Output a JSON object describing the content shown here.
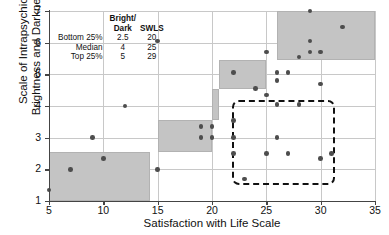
{
  "chart_data": {
    "type": "scatter",
    "title": "",
    "xlabel": "Satisfaction with Life Scale",
    "ylabel": "Scale of Intrapsychic Brightness and Darkness",
    "ylabel_line1": "Scale of Intrapsychic",
    "ylabel_line2": "Brightness and Darkness",
    "xlim": [
      5,
      35
    ],
    "ylim": [
      1,
      7
    ],
    "xticks": [
      5,
      10,
      15,
      20,
      25,
      30,
      35
    ],
    "yticks": [
      1,
      2,
      3,
      4,
      5,
      6,
      7
    ],
    "grid": true,
    "legend": "none",
    "marker_color": "#4d4d4d",
    "shade_color": "#c4c4c4",
    "dash_color": "#111111",
    "points": [
      {
        "x": 5,
        "y": 1.35
      },
      {
        "x": 7,
        "y": 2.0
      },
      {
        "x": 9,
        "y": 3.0
      },
      {
        "x": 10,
        "y": 2.35
      },
      {
        "x": 12,
        "y": 4.0
      },
      {
        "x": 15,
        "y": 6.05
      },
      {
        "x": 15,
        "y": 2.0
      },
      {
        "x": 19,
        "y": 3.35
      },
      {
        "x": 19,
        "y": 3.0
      },
      {
        "x": 20,
        "y": 3.35
      },
      {
        "x": 20,
        "y": 3.0
      },
      {
        "x": 22,
        "y": 5.05
      },
      {
        "x": 22,
        "y": 3.55
      },
      {
        "x": 22,
        "y": 3.0
      },
      {
        "x": 22,
        "y": 2.5
      },
      {
        "x": 23,
        "y": 1.7
      },
      {
        "x": 24,
        "y": 4.55
      },
      {
        "x": 25,
        "y": 5.7
      },
      {
        "x": 25,
        "y": 4.35
      },
      {
        "x": 25,
        "y": 2.5
      },
      {
        "x": 26,
        "y": 5.05
      },
      {
        "x": 26,
        "y": 4.8
      },
      {
        "x": 26,
        "y": 4.05
      },
      {
        "x": 26,
        "y": 3.0
      },
      {
        "x": 27,
        "y": 5.05
      },
      {
        "x": 27,
        "y": 2.5
      },
      {
        "x": 28,
        "y": 5.55
      },
      {
        "x": 28,
        "y": 4.05
      },
      {
        "x": 29,
        "y": 7.0
      },
      {
        "x": 29,
        "y": 6.05
      },
      {
        "x": 29,
        "y": 5.7
      },
      {
        "x": 30,
        "y": 5.7
      },
      {
        "x": 30,
        "y": 4.7
      },
      {
        "x": 30,
        "y": 2.35
      },
      {
        "x": 31,
        "y": 2.5
      },
      {
        "x": 32,
        "y": 6.5
      }
    ],
    "shaded_boxes": [
      {
        "x0": 5,
        "x1": 14.3,
        "y0": 1.0,
        "y1": 2.55
      },
      {
        "x0": 15,
        "x1": 20.0,
        "y0": 2.55,
        "y1": 3.55
      },
      {
        "x0": 20.0,
        "x1": 20.6,
        "y0": 3.55,
        "y1": 4.55
      },
      {
        "x0": 20.6,
        "x1": 25.0,
        "y0": 4.55,
        "y1": 5.45
      },
      {
        "x0": 26.0,
        "x1": 35.0,
        "y0": 5.45,
        "y1": 7.0
      }
    ],
    "dashed_region": {
      "x0": 21.8,
      "x1": 31.3,
      "y0": 1.5,
      "y1": 4.2
    }
  },
  "stats_table": {
    "col_header_1_line1": "Bright/",
    "col_header_1_line2": "Dark",
    "col_header_2": "SWLS",
    "rows": [
      {
        "label": "Bottom 25%",
        "bright_dark": "2.5",
        "swls": "20"
      },
      {
        "label": "Median",
        "bright_dark": "4",
        "swls": "25"
      },
      {
        "label": "Top 25%",
        "bright_dark": "5",
        "swls": "29"
      }
    ]
  }
}
